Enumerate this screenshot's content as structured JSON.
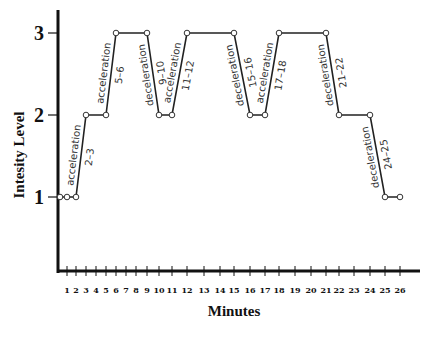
{
  "chart_data": {
    "type": "line",
    "title": "",
    "xlabel": "Minutes",
    "ylabel": "Intesity Level",
    "x_ticks": [
      1,
      2,
      3,
      4,
      5,
      6,
      7,
      8,
      9,
      10,
      11,
      12,
      13,
      14,
      15,
      16,
      17,
      18,
      19,
      20,
      21,
      22,
      23,
      24,
      25,
      26
    ],
    "y_ticks": [
      1,
      2,
      3
    ],
    "xlim": [
      0,
      27
    ],
    "ylim": [
      0,
      3.2
    ],
    "grid": false,
    "legend": null,
    "series": [
      {
        "name": "Intensity",
        "x": [
          0,
          1,
          2,
          3,
          5,
          6,
          9,
          10,
          11,
          12,
          15,
          16,
          17,
          18,
          21,
          22,
          24,
          25,
          26
        ],
        "y": [
          1,
          1,
          1,
          2,
          2,
          3,
          3,
          2,
          2,
          3,
          3,
          2,
          2,
          3,
          3,
          2,
          2,
          1,
          1
        ],
        "marker": "open-circle"
      }
    ],
    "annotations": [
      {
        "type": "acceleration",
        "range": "2–3",
        "from": 2,
        "to": 3
      },
      {
        "type": "acceleration",
        "range": "5–6",
        "from": 5,
        "to": 6
      },
      {
        "type": "deceleration",
        "range": "9–10",
        "from": 9,
        "to": 10
      },
      {
        "type": "acceleration",
        "range": "11–12",
        "from": 11,
        "to": 12
      },
      {
        "type": "deceleration",
        "range": "15–16",
        "from": 15,
        "to": 16
      },
      {
        "type": "acceleration",
        "range": "17–18",
        "from": 17,
        "to": 18
      },
      {
        "type": "deceleration",
        "range": "21–22",
        "from": 21,
        "to": 22
      },
      {
        "type": "deceleration",
        "range": "24–25",
        "from": 24,
        "to": 25
      }
    ]
  }
}
